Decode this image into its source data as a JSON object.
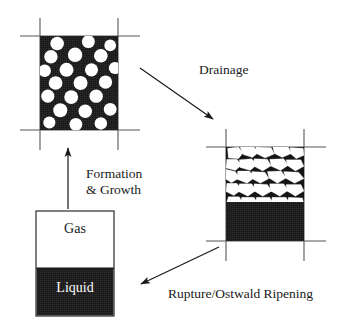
{
  "figure": {
    "background_color": "#ffffff",
    "ink_color": "#1a1a1a",
    "fill_dark_color": "#1c1c1c",
    "cell_white_color": "#ffffff"
  },
  "labels": {
    "drainage": "Drainage",
    "formation_line1": "Formation",
    "formation_line2": "& Growth",
    "rupture": "Rupture/Ostwald Ripening",
    "gas": "Gas",
    "liquid": "Liquid"
  },
  "panels": [
    {
      "id": "wet-foam",
      "name": "wet-foam-panel",
      "description": "Spherical gas bubbles dispersed in continuous dark liquid",
      "x": 40,
      "y": 36,
      "width": 78,
      "height": 94,
      "crosshair": {
        "h_x1": 20,
        "h_x2": 140,
        "v_y1": 18,
        "v_y2": 150
      }
    },
    {
      "id": "dry-foam",
      "name": "dry-foam-panel",
      "description": "Polyhedral foam cells above a drained liquid pool",
      "x": 226,
      "y": 147,
      "width": 78,
      "height": 94,
      "liquid_fraction": 0.42,
      "crosshair": {
        "h_x1": 206,
        "h_x2": 326,
        "v_y1": 129,
        "v_y2": 261
      }
    },
    {
      "id": "gas-liquid",
      "name": "gas-liquid-panel",
      "description": "Separated gas over liquid in a rectangular vessel",
      "x": 36,
      "y": 211,
      "width": 78,
      "height": 105,
      "liquid_fraction": 0.46
    }
  ],
  "arrows": [
    {
      "name": "drainage-arrow",
      "x1": 140,
      "y1": 68,
      "x2": 215,
      "y2": 121
    },
    {
      "name": "rupture-arrow",
      "x1": 219,
      "y1": 247,
      "x2": 139,
      "y2": 286
    },
    {
      "name": "formation-arrow",
      "x1": 68,
      "y1": 209,
      "x2": 68,
      "y2": 146
    }
  ],
  "bubbles": [
    [
      0.22,
      0.08,
      0.087
    ],
    [
      0.62,
      0.06,
      0.083
    ],
    [
      0.9,
      0.1,
      0.075
    ],
    [
      0.14,
      0.22,
      0.086
    ],
    [
      0.45,
      0.2,
      0.092
    ],
    [
      0.78,
      0.21,
      0.088
    ],
    [
      0.06,
      0.37,
      0.08
    ],
    [
      0.34,
      0.36,
      0.09
    ],
    [
      0.66,
      0.36,
      0.084
    ],
    [
      0.96,
      0.34,
      0.078
    ],
    [
      0.2,
      0.5,
      0.088
    ],
    [
      0.52,
      0.5,
      0.09
    ],
    [
      0.84,
      0.49,
      0.085
    ],
    [
      0.1,
      0.64,
      0.084
    ],
    [
      0.4,
      0.65,
      0.089
    ],
    [
      0.72,
      0.64,
      0.086
    ],
    [
      0.26,
      0.79,
      0.09
    ],
    [
      0.58,
      0.8,
      0.086
    ],
    [
      0.9,
      0.78,
      0.082
    ],
    [
      0.12,
      0.92,
      0.078
    ],
    [
      0.46,
      0.94,
      0.082
    ],
    [
      0.78,
      0.93,
      0.08
    ]
  ],
  "polygon_cells": [
    [
      [
        0.02,
        0.02
      ],
      [
        0.16,
        0.0
      ],
      [
        0.22,
        0.1
      ],
      [
        0.16,
        0.2
      ],
      [
        0.03,
        0.19
      ]
    ],
    [
      [
        0.18,
        0.0
      ],
      [
        0.36,
        0.0
      ],
      [
        0.42,
        0.09
      ],
      [
        0.34,
        0.18
      ],
      [
        0.22,
        0.13
      ]
    ],
    [
      [
        0.38,
        0.0
      ],
      [
        0.58,
        0.01
      ],
      [
        0.62,
        0.12
      ],
      [
        0.5,
        0.19
      ],
      [
        0.4,
        0.12
      ]
    ],
    [
      [
        0.6,
        0.0
      ],
      [
        0.8,
        0.0
      ],
      [
        0.84,
        0.11
      ],
      [
        0.72,
        0.18
      ],
      [
        0.62,
        0.11
      ]
    ],
    [
      [
        0.82,
        0.01
      ],
      [
        0.99,
        0.02
      ],
      [
        1.0,
        0.14
      ],
      [
        0.9,
        0.2
      ],
      [
        0.83,
        0.12
      ]
    ],
    [
      [
        0.01,
        0.21
      ],
      [
        0.14,
        0.21
      ],
      [
        0.2,
        0.31
      ],
      [
        0.12,
        0.4
      ],
      [
        0.0,
        0.36
      ]
    ],
    [
      [
        0.17,
        0.22
      ],
      [
        0.33,
        0.2
      ],
      [
        0.4,
        0.3
      ],
      [
        0.31,
        0.4
      ],
      [
        0.18,
        0.35
      ]
    ],
    [
      [
        0.36,
        0.2
      ],
      [
        0.53,
        0.21
      ],
      [
        0.58,
        0.32
      ],
      [
        0.47,
        0.41
      ],
      [
        0.36,
        0.33
      ]
    ],
    [
      [
        0.56,
        0.21
      ],
      [
        0.74,
        0.2
      ],
      [
        0.8,
        0.31
      ],
      [
        0.7,
        0.4
      ],
      [
        0.58,
        0.33
      ]
    ],
    [
      [
        0.77,
        0.22
      ],
      [
        0.96,
        0.22
      ],
      [
        1.0,
        0.33
      ],
      [
        0.89,
        0.41
      ],
      [
        0.79,
        0.32
      ]
    ],
    [
      [
        0.0,
        0.38
      ],
      [
        0.12,
        0.42
      ],
      [
        0.17,
        0.53
      ],
      [
        0.07,
        0.61
      ],
      [
        0.0,
        0.55
      ]
    ],
    [
      [
        0.15,
        0.41
      ],
      [
        0.3,
        0.41
      ],
      [
        0.37,
        0.52
      ],
      [
        0.27,
        0.62
      ],
      [
        0.14,
        0.55
      ]
    ],
    [
      [
        0.33,
        0.42
      ],
      [
        0.5,
        0.43
      ],
      [
        0.55,
        0.54
      ],
      [
        0.44,
        0.62
      ],
      [
        0.33,
        0.54
      ]
    ],
    [
      [
        0.53,
        0.42
      ],
      [
        0.71,
        0.41
      ],
      [
        0.77,
        0.53
      ],
      [
        0.66,
        0.62
      ],
      [
        0.55,
        0.53
      ]
    ],
    [
      [
        0.74,
        0.42
      ],
      [
        0.93,
        0.43
      ],
      [
        1.0,
        0.54
      ],
      [
        0.88,
        0.62
      ],
      [
        0.76,
        0.53
      ]
    ],
    [
      [
        0.01,
        0.62
      ],
      [
        0.14,
        0.62
      ],
      [
        0.2,
        0.73
      ],
      [
        0.1,
        0.83
      ],
      [
        0.0,
        0.76
      ]
    ],
    [
      [
        0.17,
        0.63
      ],
      [
        0.33,
        0.63
      ],
      [
        0.39,
        0.74
      ],
      [
        0.28,
        0.84
      ],
      [
        0.16,
        0.76
      ]
    ],
    [
      [
        0.36,
        0.63
      ],
      [
        0.53,
        0.64
      ],
      [
        0.59,
        0.75
      ],
      [
        0.47,
        0.84
      ],
      [
        0.36,
        0.75
      ]
    ],
    [
      [
        0.56,
        0.63
      ],
      [
        0.74,
        0.63
      ],
      [
        0.8,
        0.74
      ],
      [
        0.69,
        0.84
      ],
      [
        0.57,
        0.75
      ]
    ],
    [
      [
        0.77,
        0.64
      ],
      [
        0.96,
        0.64
      ],
      [
        1.0,
        0.75
      ],
      [
        0.89,
        0.84
      ],
      [
        0.78,
        0.75
      ]
    ],
    [
      [
        0.03,
        0.85
      ],
      [
        0.17,
        0.85
      ],
      [
        0.22,
        0.97
      ],
      [
        0.1,
        1.0
      ],
      [
        0.01,
        0.94
      ]
    ],
    [
      [
        0.2,
        0.86
      ],
      [
        0.36,
        0.86
      ],
      [
        0.41,
        0.97
      ],
      [
        0.29,
        1.0
      ],
      [
        0.19,
        0.95
      ]
    ],
    [
      [
        0.39,
        0.86
      ],
      [
        0.56,
        0.86
      ],
      [
        0.61,
        0.98
      ],
      [
        0.48,
        1.0
      ],
      [
        0.38,
        0.95
      ]
    ],
    [
      [
        0.59,
        0.86
      ],
      [
        0.77,
        0.86
      ],
      [
        0.82,
        0.98
      ],
      [
        0.69,
        1.0
      ],
      [
        0.58,
        0.95
      ]
    ],
    [
      [
        0.8,
        0.86
      ],
      [
        0.98,
        0.87
      ],
      [
        1.0,
        0.98
      ],
      [
        0.88,
        1.0
      ],
      [
        0.79,
        0.95
      ]
    ]
  ]
}
